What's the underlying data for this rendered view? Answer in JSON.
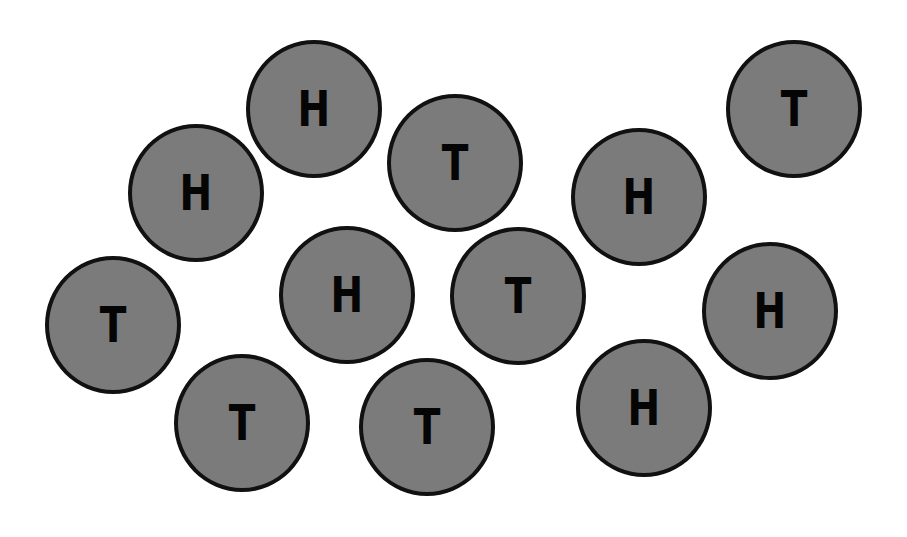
{
  "colors": {
    "background": "#ffffff",
    "coin_fill": "#7b7b7b",
    "coin_border": "#111111",
    "letter": "#050505"
  },
  "coins": [
    {
      "face": "H",
      "cx": 314,
      "cy": 109
    },
    {
      "face": "T",
      "cx": 794,
      "cy": 109
    },
    {
      "face": "H",
      "cx": 196,
      "cy": 193
    },
    {
      "face": "T",
      "cx": 455,
      "cy": 163
    },
    {
      "face": "H",
      "cx": 639,
      "cy": 197
    },
    {
      "face": "T",
      "cx": 113,
      "cy": 325
    },
    {
      "face": "H",
      "cx": 347,
      "cy": 295
    },
    {
      "face": "T",
      "cx": 518,
      "cy": 296
    },
    {
      "face": "H",
      "cx": 770,
      "cy": 311
    },
    {
      "face": "T",
      "cx": 242,
      "cy": 423
    },
    {
      "face": "T",
      "cx": 427,
      "cy": 427
    },
    {
      "face": "H",
      "cx": 644,
      "cy": 408
    }
  ],
  "summary": {
    "total": 12,
    "heads": 6,
    "tails": 6
  }
}
